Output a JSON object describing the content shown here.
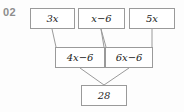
{
  "question": {
    "number": "02"
  },
  "diagram": {
    "type": "number-pyramid",
    "rows": [
      {
        "name": "top-row",
        "cells": [
          {
            "text": "3x",
            "lead": "3",
            "var": "x",
            "tail": ""
          },
          {
            "text": "x−6",
            "lead": "",
            "var": "x",
            "tail": "−6"
          },
          {
            "text": "5x",
            "lead": "5",
            "var": "x",
            "tail": ""
          }
        ]
      },
      {
        "name": "middle-row",
        "cells": [
          {
            "text": "4x−6",
            "lead": "4",
            "var": "x",
            "tail": "−6"
          },
          {
            "text": "6x−6",
            "lead": "6",
            "var": "x",
            "tail": "−6"
          }
        ]
      },
      {
        "name": "bottom-row",
        "cells": [
          {
            "text": "28",
            "lead": "28",
            "var": "",
            "tail": ""
          }
        ]
      }
    ]
  },
  "colors": {
    "box_border": "#9a9a9a",
    "connector": "#9a9a9a",
    "text": "#1c1c1c",
    "question_number": "#8d8d8d",
    "background": "#fdfdfd"
  }
}
